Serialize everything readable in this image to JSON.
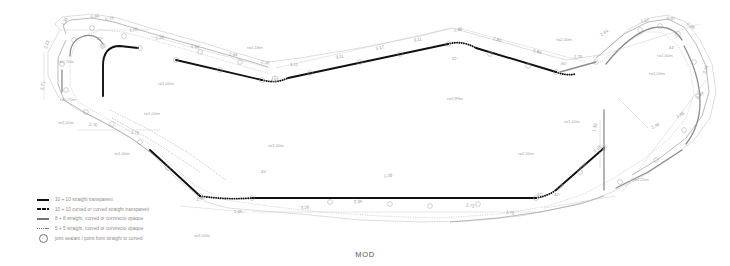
{
  "document": {
    "title": "MOD",
    "type": "cad-technical-drawing",
    "description": "Closed perimeter outline plan with dimension, radius and angle annotations",
    "colors": {
      "paper": "#ffffff",
      "heavy_line": "#111111",
      "light_line": "#9a9a9a",
      "dimension_text": "#9a9a9a",
      "radius_text": "#a8a8a8"
    }
  },
  "legend": {
    "items": [
      {
        "symbol": "thick-solid-line",
        "label": "10 + 10 straight transparent"
      },
      {
        "symbol": "thick-dashed-line",
        "label": "10 + 10 curved or curved straight transparent"
      },
      {
        "symbol": "medium-solid-line",
        "label": "8 + 8 straight, curved or curvirecto opaque"
      },
      {
        "symbol": "thin-dashed-line",
        "label": "5 + 5 straight, curved or curvirecto opaque"
      },
      {
        "symbol": "joint-node-circle",
        "label": "joint sealant / point from straight to curved"
      }
    ]
  },
  "annotations": {
    "dimensions_top": [
      {
        "value": "1,35",
        "x": 66,
        "y": 22,
        "rot": -62
      },
      {
        "value": "0,94",
        "x": 95,
        "y": 18,
        "rot": -8
      },
      {
        "value": "0,76",
        "x": 110,
        "y": 20,
        "rot": -14
      },
      {
        "value": "2,23",
        "x": 48,
        "y": 45,
        "rot": -72
      },
      {
        "value": "1,05",
        "x": 134,
        "y": 31,
        "rot": -10
      },
      {
        "value": "1,36",
        "x": 160,
        "y": 39,
        "rot": -6
      },
      {
        "value": "2,94",
        "x": 195,
        "y": 48,
        "rot": 9
      },
      {
        "value": "2,94",
        "x": 233,
        "y": 56,
        "rot": 9
      },
      {
        "value": "2,36",
        "x": 265,
        "y": 64,
        "rot": 9
      },
      {
        "value": "3,11",
        "x": 294,
        "y": 66,
        "rot": 0
      },
      {
        "value": "3,11",
        "x": 340,
        "y": 58,
        "rot": -12
      },
      {
        "value": "3,17",
        "x": 380,
        "y": 49,
        "rot": -12
      },
      {
        "value": "3,11",
        "x": 418,
        "y": 41,
        "rot": -12
      },
      {
        "value": "1,88",
        "x": 458,
        "y": 31,
        "rot": -6
      },
      {
        "value": "2,80",
        "x": 497,
        "y": 41,
        "rot": 14
      },
      {
        "value": "2,80",
        "x": 537,
        "y": 53,
        "rot": 14
      },
      {
        "value": "2,70",
        "x": 578,
        "y": 58,
        "rot": 2
      },
      {
        "value": "2,64",
        "x": 605,
        "y": 34,
        "rot": -30
      },
      {
        "value": "1,27",
        "x": 645,
        "y": 22,
        "rot": -8
      },
      {
        "value": "0,87",
        "x": 671,
        "y": 20,
        "rot": 6
      },
      {
        "value": "0,85",
        "x": 690,
        "y": 27,
        "rot": 34
      }
    ],
    "dimensions_left": [
      {
        "value": "2,71",
        "x": 44,
        "y": 86,
        "rot": -78
      },
      {
        "value": "2,76",
        "x": 93,
        "y": 126,
        "rot": 4
      },
      {
        "value": "2,75",
        "x": 135,
        "y": 134,
        "rot": 4
      }
    ],
    "dimensions_bottom": [
      {
        "value": "2,96",
        "x": 201,
        "y": 200,
        "rot": -14
      },
      {
        "value": "2,05",
        "x": 238,
        "y": 213,
        "rot": 0
      },
      {
        "value": "3,26",
        "x": 305,
        "y": 209,
        "rot": -4
      },
      {
        "value": "3,34",
        "x": 358,
        "y": 203,
        "rot": -4
      },
      {
        "value": "1,28",
        "x": 388,
        "y": 177,
        "rot": -4
      },
      {
        "value": "2,73",
        "x": 470,
        "y": 207,
        "rot": 6
      },
      {
        "value": "2,75",
        "x": 510,
        "y": 214,
        "rot": 6
      },
      {
        "value": "2,16",
        "x": 561,
        "y": 188,
        "rot": -42
      },
      {
        "value": "2,05",
        "x": 584,
        "y": 167,
        "rot": -42
      },
      {
        "value": "2,16",
        "x": 598,
        "y": 150,
        "rot": -42
      },
      {
        "value": "1,38",
        "x": 596,
        "y": 128,
        "rot": -72
      },
      {
        "value": "2,45",
        "x": 656,
        "y": 127,
        "rot": -28
      },
      {
        "value": "1,65",
        "x": 681,
        "y": 116,
        "rot": -28
      },
      {
        "value": "2,39",
        "x": 701,
        "y": 96,
        "rot": -48
      },
      {
        "value": "2,16",
        "x": 707,
        "y": 70,
        "rot": -74
      }
    ],
    "radii": [
      {
        "value": "r=0,70m",
        "x": 66,
        "y": 63
      },
      {
        "value": "r=0,70m",
        "x": 68,
        "y": 101
      },
      {
        "value": "r=1,00m",
        "x": 66,
        "y": 124
      },
      {
        "value": "r=1,00m",
        "x": 152,
        "y": 115
      },
      {
        "value": "r=1,00m",
        "x": 122,
        "y": 155
      },
      {
        "value": "r=1,00m",
        "x": 166,
        "y": 85
      },
      {
        "value": "r=1,58m",
        "x": 255,
        "y": 49
      },
      {
        "value": "r=0,99m",
        "x": 455,
        "y": 100
      },
      {
        "value": "r=2,00m",
        "x": 564,
        "y": 41
      },
      {
        "value": "r=3,00m",
        "x": 276,
        "y": 147
      },
      {
        "value": "r=2,00m",
        "x": 526,
        "y": 155
      },
      {
        "value": "r=1,00m",
        "x": 572,
        "y": 123
      },
      {
        "value": "r=1,00m",
        "x": 665,
        "y": 57
      },
      {
        "value": "r=1,00m",
        "x": 657,
        "y": 75
      },
      {
        "value": "r=2,20m",
        "x": 641,
        "y": 181
      },
      {
        "value": "r=3,00m",
        "x": 202,
        "y": 237
      }
    ],
    "angles": [
      {
        "value": "31°",
        "x": 455,
        "y": 60
      },
      {
        "value": "46°",
        "x": 564,
        "y": 65
      },
      {
        "value": "45°",
        "x": 264,
        "y": 173
      },
      {
        "value": "32°",
        "x": 540,
        "y": 196
      },
      {
        "value": "32°",
        "x": 557,
        "y": 196
      },
      {
        "value": "44°",
        "x": 672,
        "y": 49
      },
      {
        "value": "40°",
        "x": 100,
        "y": 40
      }
    ]
  }
}
